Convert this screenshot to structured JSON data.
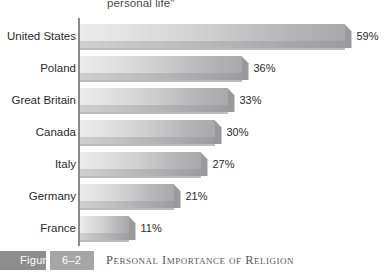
{
  "heading": {
    "text": "personal life\""
  },
  "caption": {
    "figure_word": "Figure",
    "figure_number": "6–2",
    "title": "Personal Importance of Religion",
    "figure_word_color": "#8d8d8d",
    "figure_number_color": "#a6a6a6"
  },
  "axis": {
    "line_color": "#8a8a8a"
  },
  "style": {
    "bar_light": "#ececed",
    "bar_dark": "#a9a9ac",
    "bar_shadow": "#b2b2b4",
    "label_color": "#2b2b2b",
    "background": "#ffffff"
  },
  "chart_data": {
    "type": "bar",
    "orientation": "horizontal",
    "title": "Personal Importance of Religion",
    "subtitle": "personal life\"",
    "xlabel": "",
    "ylabel": "",
    "xlim": [
      0,
      65
    ],
    "grid": false,
    "legend": "none",
    "categories": [
      "United States",
      "Poland",
      "Great Britain",
      "Canada",
      "Italy",
      "Germany",
      "France"
    ],
    "values": [
      59,
      36,
      33,
      30,
      27,
      21,
      11
    ],
    "value_labels": [
      "59%",
      "36%",
      "33%",
      "30%",
      "27%",
      "21%",
      "11%"
    ],
    "units": "percent"
  }
}
